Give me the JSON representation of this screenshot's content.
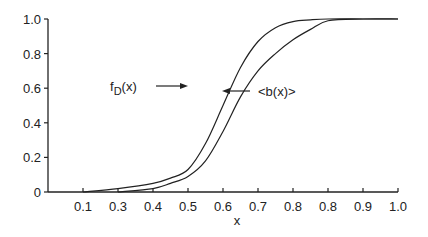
{
  "chart_data": {
    "type": "line",
    "title": "",
    "xlabel": "x",
    "ylabel": "",
    "xlim": [
      0.0,
      1.0
    ],
    "ylim": [
      0.0,
      1.0
    ],
    "grid": false,
    "legend": "none (inline arrow annotations)",
    "x_tick_labels": [
      "0.1",
      "0.3",
      "0.4",
      "0.5",
      "0.6",
      "0.7",
      "0.8",
      "0.8",
      "0.9",
      "1.0"
    ],
    "y_tick_labels": [
      "0",
      "0.2",
      "0.4",
      "0.6",
      "0.8",
      "1.0"
    ],
    "series": [
      {
        "name": "fD(x)",
        "label_main": "f",
        "label_sub": "D",
        "label_tail": "(x)",
        "x": [
          0.1,
          0.2,
          0.3,
          0.35,
          0.4,
          0.45,
          0.5,
          0.55,
          0.6,
          0.65,
          0.7,
          0.75,
          0.8,
          0.9,
          1.0
        ],
        "y": [
          0.0,
          0.02,
          0.05,
          0.08,
          0.13,
          0.28,
          0.5,
          0.72,
          0.87,
          0.95,
          0.985,
          0.995,
          1.0,
          1.0,
          1.0
        ]
      },
      {
        "name": "<b(x)>",
        "x": [
          0.2,
          0.3,
          0.35,
          0.4,
          0.45,
          0.5,
          0.55,
          0.6,
          0.65,
          0.7,
          0.75,
          0.8,
          0.9,
          1.0
        ],
        "y": [
          0.0,
          0.02,
          0.05,
          0.09,
          0.18,
          0.35,
          0.55,
          0.7,
          0.8,
          0.88,
          0.94,
          0.99,
          1.0,
          1.0
        ]
      }
    ],
    "annotations": [
      {
        "text": "fD(x)",
        "arrow": "right",
        "points_to": "fD(x)"
      },
      {
        "text": "<b(x)>",
        "arrow": "left",
        "points_to": "<b(x)>"
      }
    ]
  },
  "labels": {
    "xlabel": "x",
    "fd_main": "f",
    "fd_sub": "D",
    "fd_tail": "(x)",
    "bx": "<b(x)>"
  }
}
